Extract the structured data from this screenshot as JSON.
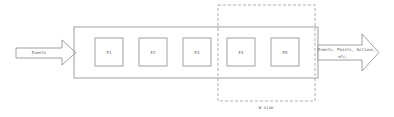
{
  "diagram": {
    "input_arrow": {
      "label": "Events"
    },
    "pipeline": {
      "boxes": [
        {
          "label": "E1"
        },
        {
          "label": "E2"
        },
        {
          "label": "E3"
        },
        {
          "label": "E4"
        },
        {
          "label": "E5"
        }
      ]
    },
    "window": {
      "label": "W size"
    },
    "output_arrow": {
      "label_line1": "Events, Points, Actions,",
      "label_line2": "etc."
    }
  },
  "colors": {
    "stroke": "#888888",
    "dashed": "#999999",
    "background": "#ffffff"
  }
}
